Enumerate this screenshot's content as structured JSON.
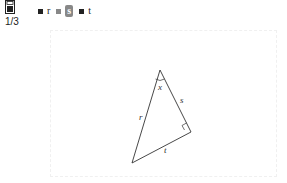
{
  "toolbar": {
    "page_indicator": "1/3",
    "legend": [
      {
        "label": "r",
        "swatch_color": "#222222",
        "active": false
      },
      {
        "label": "s",
        "swatch_color": "#888888",
        "active": true
      },
      {
        "label": "t",
        "swatch_color": "#222222",
        "active": false
      }
    ]
  },
  "diagram": {
    "type": "right-triangle",
    "vertices": {
      "top": [
        160,
        70
      ],
      "right": [
        191,
        132
      ],
      "bottom_left": [
        132,
        163
      ]
    },
    "labels": {
      "angle": "x",
      "side_top_right": "s",
      "side_left": "r",
      "side_bottom": "t"
    },
    "right_angle_at": "right"
  }
}
